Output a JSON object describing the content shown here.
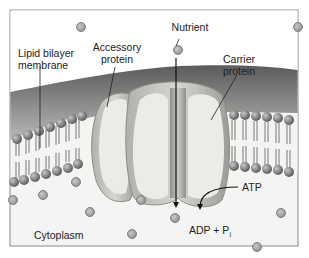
{
  "diagram": {
    "colors": {
      "frame": "#8a8a8a",
      "background": "#f3f3f1",
      "membrane_top": "#6f6f6f",
      "lipid_head": "#7a7a7a",
      "protein_fill": "#e9e9e5",
      "protein_edge": "#9a9a96",
      "molecule": "#a8a8a8"
    },
    "labels": {
      "lipid_bilayer_line1": "Lipid bilayer",
      "lipid_bilayer_line2": "membrane",
      "accessory_line1": "Accessory",
      "accessory_line2": "protein",
      "nutrient": "Nutrient",
      "carrier_line1": "Carrier",
      "carrier_line2": "protein",
      "atp": "ATP",
      "adp": "ADP + P",
      "adp_sub": "i",
      "cytoplasm": "Cytoplasm"
    },
    "nodes": [
      {
        "id": "lipid-bilayer",
        "label": "Lipid bilayer membrane"
      },
      {
        "id": "accessory-protein",
        "label": "Accessory protein"
      },
      {
        "id": "carrier-protein",
        "label": "Carrier protein"
      },
      {
        "id": "nutrient",
        "label": "Nutrient"
      },
      {
        "id": "atp",
        "label": "ATP"
      },
      {
        "id": "adp-pi",
        "label": "ADP + Pi"
      },
      {
        "id": "cytoplasm",
        "label": "Cytoplasm"
      }
    ],
    "edges": [
      {
        "from": "nutrient",
        "to": "cytoplasm",
        "kind": "transport-arrow",
        "via": "carrier-protein"
      },
      {
        "from": "atp",
        "to": "adp-pi",
        "kind": "reaction-arrow"
      }
    ]
  }
}
